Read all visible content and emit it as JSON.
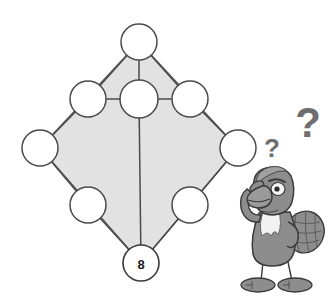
{
  "puzzle": {
    "title": "Number pyramid diamond puzzle",
    "shape": "diamond",
    "filled_color": "#e2e2e2",
    "outline_color": "#5a5a5a",
    "circle_fill": "#ffffff",
    "node_count": 8,
    "nodes": [
      {
        "id": "apex",
        "label": "",
        "cx": 139,
        "cy": 42,
        "r": 18
      },
      {
        "id": "upper-left",
        "label": "",
        "cx": 88,
        "cy": 99,
        "r": 18
      },
      {
        "id": "upper-center",
        "label": "",
        "cx": 139,
        "cy": 99,
        "r": 19
      },
      {
        "id": "upper-right",
        "label": "",
        "cx": 190,
        "cy": 99,
        "r": 18
      },
      {
        "id": "mid-left",
        "label": "",
        "cx": 40,
        "cy": 148,
        "r": 18
      },
      {
        "id": "mid-right",
        "label": "",
        "cx": 238,
        "cy": 148,
        "r": 18
      },
      {
        "id": "lower-left",
        "label": "",
        "cx": 88,
        "cy": 205,
        "r": 18
      },
      {
        "id": "lower-right",
        "label": "",
        "cx": 190,
        "cy": 205,
        "r": 18
      },
      {
        "id": "bottom",
        "label": "8",
        "cx": 141,
        "cy": 263,
        "r": 18
      }
    ],
    "given_value": "8",
    "question_marks": [
      {
        "id": "small-question-mark",
        "glyph": "?",
        "x": 272,
        "y": 148,
        "size": 26
      },
      {
        "id": "large-question-mark",
        "glyph": "?",
        "x": 308,
        "y": 122,
        "size": 42
      }
    ],
    "character": {
      "name": "thinking-bird",
      "species": "bird",
      "pose": "thinking",
      "body_color": "#8d8d8d",
      "body_shadow": "#6f6f6f",
      "body_light": "#a6a6a6",
      "chest_color": "#f2f2f2",
      "beak_color": "#9a9a9a",
      "eye_white": "#f4f4f4",
      "outline_color": "#3a3a3a"
    }
  }
}
